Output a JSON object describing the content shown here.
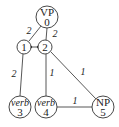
{
  "nodes": [
    {
      "id": "VP",
      "label": "VP",
      "index": "0",
      "italic": false
    },
    {
      "id": "n1",
      "label": "",
      "index": "1",
      "italic": false
    },
    {
      "id": "n2",
      "label": "",
      "index": "2",
      "italic": false
    },
    {
      "id": "verb3",
      "label": "verb",
      "index": "3",
      "italic": true
    },
    {
      "id": "verb4",
      "label": "verb",
      "index": "4",
      "italic": true
    },
    {
      "id": "NP5",
      "label": "NP",
      "index": "5",
      "italic": false
    }
  ],
  "edges": [
    {
      "from": "VP",
      "to": "n1",
      "weight": "2"
    },
    {
      "from": "VP",
      "to": "n2",
      "weight": "2"
    },
    {
      "from": "n1",
      "to": "n2",
      "weight": "",
      "type": "bidirectional-arrow"
    },
    {
      "from": "n1",
      "to": "verb3",
      "weight": "2"
    },
    {
      "from": "n2",
      "to": "verb4",
      "weight": "1"
    },
    {
      "from": "n2",
      "to": "NP5",
      "weight": "1"
    },
    {
      "from": "verb4",
      "to": "NP5",
      "weight": "1"
    }
  ]
}
